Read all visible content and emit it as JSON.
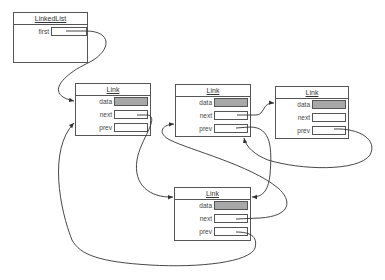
{
  "linked_list": {
    "title": "LinkedList",
    "fields": [
      {
        "label": "first"
      }
    ]
  },
  "links": [
    {
      "id": "link-1",
      "title": "Link",
      "fields": [
        {
          "label": "data"
        },
        {
          "label": "next"
        },
        {
          "label": "prev"
        }
      ]
    },
    {
      "id": "link-2",
      "title": "Link",
      "fields": [
        {
          "label": "data"
        },
        {
          "label": "next"
        },
        {
          "label": "prev"
        }
      ]
    },
    {
      "id": "link-3",
      "title": "Link",
      "fields": [
        {
          "label": "data"
        },
        {
          "label": "next"
        },
        {
          "label": "prev"
        }
      ]
    },
    {
      "id": "link-4",
      "title": "Link",
      "fields": [
        {
          "label": "data"
        },
        {
          "label": "next"
        },
        {
          "label": "prev"
        }
      ]
    }
  ],
  "colors": {
    "data_fill": "#a8a8a8",
    "stroke": "#555555",
    "arrow": "#333333"
  },
  "connections": [
    {
      "from": "LinkedList.first",
      "to": "link-1"
    },
    {
      "from": "link-1.next",
      "to": "link-4"
    },
    {
      "from": "link-4.next",
      "to": "link-2"
    },
    {
      "from": "link-2.next",
      "to": "link-3"
    },
    {
      "from": "link-3.prev",
      "to": "link-2"
    },
    {
      "from": "link-2.prev",
      "to": "link-4"
    },
    {
      "from": "link-4.prev",
      "to": "link-1"
    }
  ]
}
